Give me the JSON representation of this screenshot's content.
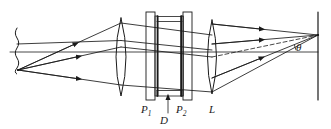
{
  "figure": {
    "type": "optics-ray-diagram",
    "background_color": "#ffffff",
    "stroke_color": "#1a1a1a"
  },
  "labels": {
    "plate1": {
      "base": "P",
      "sub": "1"
    },
    "plate2": {
      "base": "P",
      "sub": "2"
    },
    "spacing": "D",
    "lens": "L",
    "angle": "θ"
  },
  "components": [
    {
      "name": "source-screen",
      "kind": "wavy-vertical-line",
      "x": 17,
      "y_top": 28,
      "y_bottom": 72
    },
    {
      "name": "source-point",
      "kind": "point",
      "x": 18,
      "y": 70
    },
    {
      "name": "collimating-lens",
      "kind": "biconvex-lens",
      "x": 121,
      "y_top": 18,
      "y_bottom": 96
    },
    {
      "name": "etalon-plate-1",
      "kind": "plate",
      "x": 150,
      "y_top": 12,
      "y_bottom": 100
    },
    {
      "name": "etalon-plate-2",
      "kind": "plate",
      "x": 184,
      "y_top": 12,
      "y_bottom": 100
    },
    {
      "name": "etalon-gap",
      "kind": "spacer",
      "x_left": 156,
      "x_right": 180
    },
    {
      "name": "focusing-lens",
      "kind": "biconvex-lens",
      "x": 212,
      "y_top": 20,
      "y_bottom": 94
    },
    {
      "name": "observation-screen",
      "kind": "vertical-line",
      "x": 318,
      "y_top": 12,
      "y_bottom": 100
    },
    {
      "name": "optical-axis",
      "kind": "horizontal-line",
      "y": 52,
      "x_left": 10,
      "x_right": 318
    },
    {
      "name": "focus-point",
      "kind": "point",
      "x": 318,
      "y": 35
    }
  ],
  "rays": {
    "count": 3,
    "from": "source-point",
    "to": "focus-point",
    "arrowheads": 9,
    "dashed_reference_ray": true
  },
  "angle_marker": {
    "label": "θ",
    "vertex_x": 318,
    "vertex_y": 35,
    "between": [
      "dashed-ray",
      "optical-axis"
    ]
  }
}
